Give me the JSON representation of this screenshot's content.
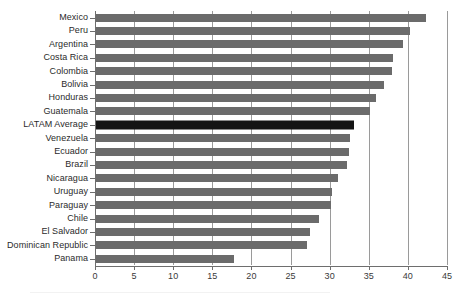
{
  "chart_data": {
    "type": "bar",
    "orientation": "horizontal",
    "title": "",
    "xlabel": "",
    "ylabel": "",
    "xlim": [
      0,
      45
    ],
    "xticks": [
      0,
      5,
      10,
      15,
      20,
      25,
      30,
      35,
      40,
      45
    ],
    "xtick_labels": [
      "0",
      "5",
      "10",
      "15",
      "20",
      "25",
      "30",
      "35",
      "40",
      "45"
    ],
    "grid": true,
    "grid_axis": "x",
    "legend": false,
    "bar_color": "#6b6b6b",
    "highlight_color": "#141414",
    "highlight_category": "LATAM Average",
    "categories": [
      "Mexico",
      "Peru",
      "Argentina",
      "Costa Rica",
      "Colombia",
      "Bolivia",
      "Honduras",
      "Guatemala",
      "LATAM Average",
      "Venezuela",
      "Ecuador",
      "Brazil",
      "Nicaragua",
      "Uruguay",
      "Paraguay",
      "Chile",
      "El Salvador",
      "Dominican Republic",
      "Panama"
    ],
    "values": [
      42.2,
      40.2,
      39.3,
      38.0,
      37.8,
      36.8,
      35.8,
      35.0,
      33.0,
      32.5,
      32.3,
      32.1,
      31.0,
      30.2,
      30.0,
      28.5,
      27.3,
      27.0,
      17.7
    ]
  }
}
